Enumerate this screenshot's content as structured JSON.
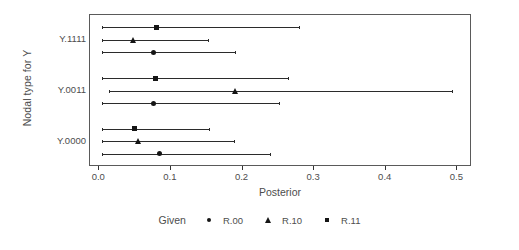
{
  "chart_data": {
    "type": "scatter",
    "title": "",
    "xlabel": "Posterior",
    "ylabel": "Nodal type for Y",
    "xlim": [
      -0.013,
      0.5205
    ],
    "xticks": [
      0.0,
      0.1,
      0.2,
      0.3,
      0.4,
      0.5
    ],
    "xtick_labels": [
      "0.0",
      "0.1",
      "0.2",
      "0.3",
      "0.4",
      "0.5"
    ],
    "categories": [
      "Y.1111",
      "Y.0011",
      "Y.0000"
    ],
    "grid": false,
    "legend_position": "bottom",
    "legend_title": "Given",
    "series": [
      {
        "name": "R.00",
        "marker": "circle",
        "points": [
          {
            "category": "Y.1111",
            "estimate": 0.075,
            "low": 0.004,
            "high": 0.191
          },
          {
            "category": "Y.0011",
            "estimate": 0.075,
            "low": 0.004,
            "high": 0.252
          },
          {
            "category": "Y.0000",
            "estimate": 0.084,
            "low": 0.004,
            "high": 0.24
          }
        ]
      },
      {
        "name": "R.10",
        "marker": "triangle",
        "points": [
          {
            "category": "Y.1111",
            "estimate": 0.048,
            "low": 0.004,
            "high": 0.153
          },
          {
            "category": "Y.0011",
            "estimate": 0.19,
            "low": 0.013,
            "high": 0.494
          },
          {
            "category": "Y.0000",
            "estimate": 0.055,
            "low": 0.004,
            "high": 0.19
          }
        ]
      },
      {
        "name": "R.11",
        "marker": "square",
        "points": [
          {
            "category": "Y.1111",
            "estimate": 0.08,
            "low": 0.004,
            "high": 0.28
          },
          {
            "category": "Y.0011",
            "estimate": 0.078,
            "low": 0.004,
            "high": 0.265
          },
          {
            "category": "Y.0000",
            "estimate": 0.049,
            "low": 0.004,
            "high": 0.155
          }
        ]
      }
    ]
  },
  "axes": {
    "y_title": "Nodal type for Y",
    "x_title": "Posterior",
    "y_tick_labels": [
      "Y.1111",
      "Y.0011",
      "Y.0000"
    ],
    "x_tick_labels": [
      "0.0",
      "0.1",
      "0.2",
      "0.3",
      "0.4",
      "0.5"
    ]
  },
  "legend": {
    "title": "Given",
    "entries": [
      {
        "label": "R.00",
        "glyph": "circle-marker-icon"
      },
      {
        "label": "R.10",
        "glyph": "triangle-marker-icon"
      },
      {
        "label": "R.11",
        "glyph": "square-marker-icon"
      }
    ]
  },
  "colors": {
    "marker": "#151515",
    "line": "#2b2b2b",
    "panel_border": "#5a5a5a",
    "text": "#4d4d4d",
    "background": "#ffffff"
  }
}
